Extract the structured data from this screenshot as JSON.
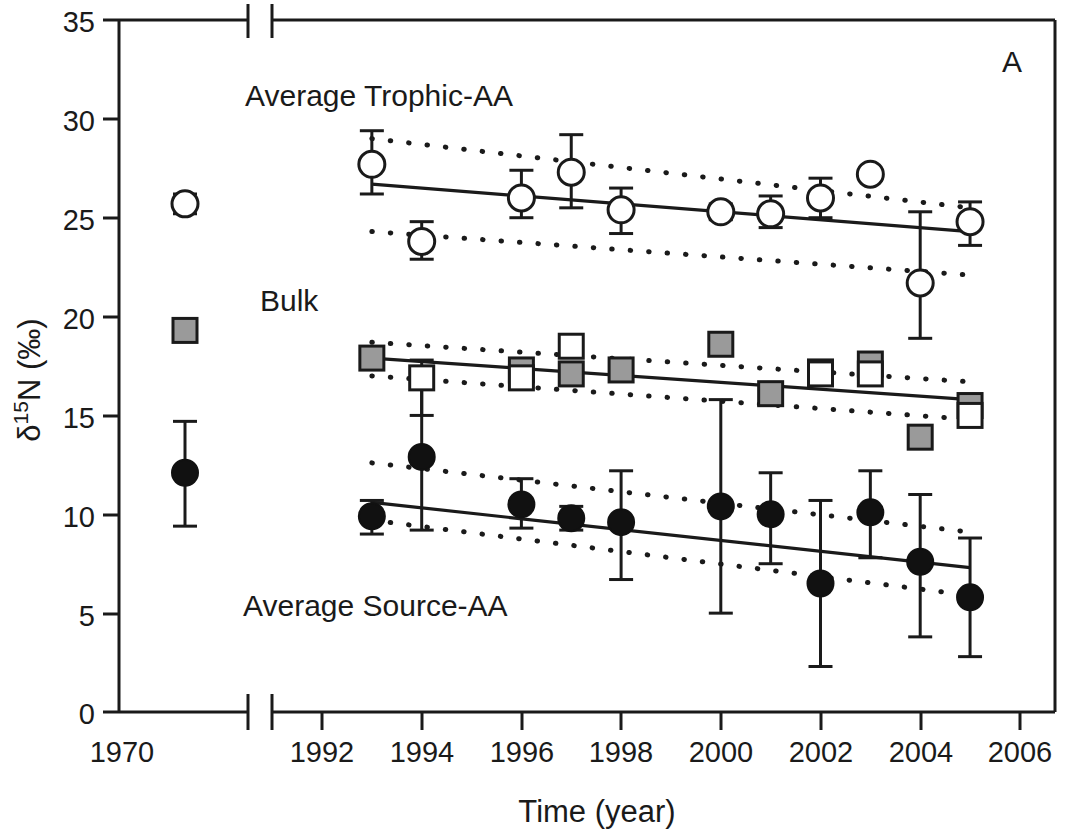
{
  "panel": {
    "label": "A"
  },
  "axes": {
    "x": {
      "title": "Time (year)",
      "ticks": [
        "1970",
        "1992",
        "1994",
        "1996",
        "1998",
        "2000",
        "2002",
        "2004",
        "2006"
      ],
      "broken": true,
      "break_note": "axis break between 1970 and 1992"
    },
    "y": {
      "title_delta": "δ",
      "title_sup": "15",
      "title_rest": "N (‰)",
      "title_plain": "δ15N (‰)",
      "ticks": [
        "0",
        "5",
        "10",
        "15",
        "20",
        "25",
        "30",
        "35"
      ],
      "min": 0,
      "max": 35
    }
  },
  "annotations": [
    {
      "id": "trophic",
      "text": "Average Trophic-AA"
    },
    {
      "id": "bulk",
      "text": "Bulk"
    },
    {
      "id": "source",
      "text": "Average Source-AA"
    }
  ],
  "colors": {
    "line": "#1a1a1a",
    "open_marker_fill": "#ffffff",
    "filled_marker": "#111111",
    "gray_marker": "#9a9a9a",
    "background": "#ffffff"
  },
  "chart_data": {
    "type": "scatter",
    "title": "",
    "xlabel": "Time (year)",
    "ylabel": "δ15N (‰)",
    "xlim": [
      1992,
      2006
    ],
    "ylim": [
      0,
      35
    ],
    "grid": false,
    "legend": "none (inline text annotations)",
    "x_axis_break": {
      "isolated_point_year": 1970,
      "resumes_at": 1992
    },
    "series": [
      {
        "name": "Average Trophic-AA",
        "marker": "open-circle",
        "points": [
          {
            "x": 1970,
            "y": 25.7,
            "err_low": 25.2,
            "err_high": 26.2,
            "isolated": true
          },
          {
            "x": 1993,
            "y": 27.7,
            "err_low": 26.2,
            "err_high": 29.4
          },
          {
            "x": 1994,
            "y": 23.8,
            "err_low": 22.9,
            "err_high": 24.8
          },
          {
            "x": 1996,
            "y": 26.0,
            "err_low": 25.0,
            "err_high": 27.4
          },
          {
            "x": 1997,
            "y": 27.3,
            "err_low": 25.5,
            "err_high": 29.2
          },
          {
            "x": 1998,
            "y": 25.4,
            "err_low": 24.2,
            "err_high": 26.5
          },
          {
            "x": 2000,
            "y": 25.3,
            "err_low": 24.9,
            "err_high": 25.7
          },
          {
            "x": 2001,
            "y": 25.2,
            "err_low": 24.5,
            "err_high": 26.1
          },
          {
            "x": 2002,
            "y": 26.0,
            "err_low": 25.0,
            "err_high": 27.0
          },
          {
            "x": 2003,
            "y": 27.2,
            "err_low": 26.9,
            "err_high": 27.5
          },
          {
            "x": 2004,
            "y": 21.7,
            "err_low": 18.9,
            "err_high": 25.3
          },
          {
            "x": 2005,
            "y": 24.8,
            "err_low": 23.6,
            "err_high": 25.8
          }
        ],
        "fit": {
          "x0": 1993,
          "y0": 26.7,
          "x1": 2005,
          "y1": 24.3
        },
        "ci_upper": {
          "x0": 1993,
          "y0": 29.0,
          "x1": 2005,
          "y1": 25.5
        },
        "ci_lower": {
          "x0": 1993,
          "y0": 24.3,
          "x1": 2005,
          "y1": 22.1
        }
      },
      {
        "name": "Bulk (gray squares)",
        "marker": "gray-square",
        "points": [
          {
            "x": 1970,
            "y": 19.3,
            "isolated": true
          },
          {
            "x": 1993,
            "y": 17.9
          },
          {
            "x": 1996,
            "y": 17.3
          },
          {
            "x": 1997,
            "y": 17.1
          },
          {
            "x": 1998,
            "y": 17.3
          },
          {
            "x": 2000,
            "y": 18.6
          },
          {
            "x": 2001,
            "y": 16.1
          },
          {
            "x": 2002,
            "y": 17.2
          },
          {
            "x": 2003,
            "y": 17.6
          },
          {
            "x": 2004,
            "y": 13.9
          },
          {
            "x": 2005,
            "y": 15.5
          }
        ],
        "fit": {
          "x0": 1993,
          "y0": 17.9,
          "x1": 2005,
          "y1": 15.8
        },
        "ci_upper": {
          "x0": 1993,
          "y0": 18.7,
          "x1": 2005,
          "y1": 16.7
        },
        "ci_lower": {
          "x0": 1993,
          "y0": 17.0,
          "x1": 2005,
          "y1": 14.8
        }
      },
      {
        "name": "Bulk (open squares)",
        "marker": "open-square",
        "points": [
          {
            "x": 1994,
            "y": 16.9,
            "err_low": 15.0,
            "err_high": 17.8
          },
          {
            "x": 1996,
            "y": 16.9
          },
          {
            "x": 1997,
            "y": 18.5
          },
          {
            "x": 2002,
            "y": 17.1
          },
          {
            "x": 2003,
            "y": 17.1
          },
          {
            "x": 2005,
            "y": 15.0
          }
        ]
      },
      {
        "name": "Average Source-AA",
        "marker": "filled-circle",
        "points": [
          {
            "x": 1970,
            "y": 12.1,
            "err_low": 9.4,
            "err_high": 14.7,
            "isolated": true
          },
          {
            "x": 1993,
            "y": 9.9,
            "err_low": 9.0,
            "err_high": 10.7
          },
          {
            "x": 1994,
            "y": 12.9,
            "err_low": 9.2,
            "err_high": 16.6
          },
          {
            "x": 1996,
            "y": 10.5,
            "err_low": 9.3,
            "err_high": 11.8
          },
          {
            "x": 1997,
            "y": 9.8,
            "err_low": 9.2,
            "err_high": 10.4
          },
          {
            "x": 1998,
            "y": 9.6,
            "err_low": 6.7,
            "err_high": 12.2
          },
          {
            "x": 2000,
            "y": 10.4,
            "err_low": 5.0,
            "err_high": 15.8
          },
          {
            "x": 2001,
            "y": 10.0,
            "err_low": 7.5,
            "err_high": 12.1
          },
          {
            "x": 2002,
            "y": 6.5,
            "err_low": 2.3,
            "err_high": 10.7
          },
          {
            "x": 2003,
            "y": 10.1,
            "err_low": 7.8,
            "err_high": 12.2
          },
          {
            "x": 2004,
            "y": 7.6,
            "err_low": 3.8,
            "err_high": 11.0
          },
          {
            "x": 2005,
            "y": 5.8,
            "err_low": 2.8,
            "err_high": 8.8
          }
        ],
        "fit": {
          "x0": 1993,
          "y0": 10.6,
          "x1": 2005,
          "y1": 7.3
        },
        "ci_upper": {
          "x0": 1993,
          "y0": 12.6,
          "x1": 2005,
          "y1": 9.1
        },
        "ci_lower": {
          "x0": 1993,
          "y0": 9.7,
          "x1": 2005,
          "y1": 5.9
        }
      }
    ]
  }
}
